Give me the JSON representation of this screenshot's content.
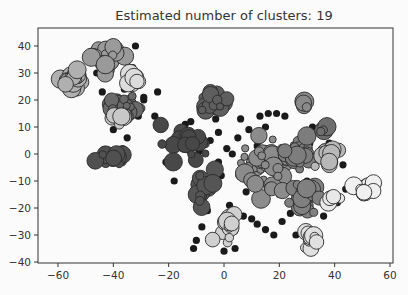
{
  "chart_data": {
    "type": "scatter",
    "title": "Estimated number of clusters: 19",
    "xlabel": "",
    "ylabel": "",
    "xlim": [
      -65,
      63
    ],
    "ylim": [
      -41,
      46
    ],
    "xticks": [
      -60,
      -40,
      -20,
      0,
      20,
      40,
      60
    ],
    "yticks": [
      40,
      30,
      20,
      10,
      0,
      -10,
      -20,
      -30,
      -40
    ],
    "xtick_labels": [
      "−60",
      "−40",
      "−20",
      "0",
      "20",
      "40",
      "60"
    ],
    "ytick_labels": [
      "40",
      "30",
      "20",
      "10",
      "0",
      "−10",
      "−20",
      "−30",
      "−40"
    ],
    "grid": false,
    "legend": null,
    "colormap": "grayscale",
    "n_clusters": 19,
    "noise_color": "#1a1a1a",
    "clusters": [
      {
        "id": 0,
        "center": [
          -42,
          36
        ],
        "spread": [
          5,
          4
        ],
        "color": "#9a9a9a",
        "n": 26
      },
      {
        "id": 1,
        "center": [
          -55,
          28
        ],
        "spread": [
          4,
          3
        ],
        "color": "#b0b0b0",
        "n": 20
      },
      {
        "id": 2,
        "center": [
          -33,
          27
        ],
        "spread": [
          3,
          3
        ],
        "color": "#dcdcdc",
        "n": 14
      },
      {
        "id": 3,
        "center": [
          -36,
          18
        ],
        "spread": [
          5,
          3
        ],
        "color": "#6a6a6a",
        "n": 22
      },
      {
        "id": 4,
        "center": [
          -38,
          13
        ],
        "spread": [
          3,
          2
        ],
        "color": "#c8c8c8",
        "n": 8
      },
      {
        "id": 5,
        "center": [
          -40,
          -1
        ],
        "spread": [
          5,
          3
        ],
        "color": "#505050",
        "n": 20
      },
      {
        "id": 6,
        "center": [
          -14,
          4
        ],
        "spread": [
          7,
          5
        ],
        "color": "#484848",
        "n": 24
      },
      {
        "id": 7,
        "center": [
          -3,
          18
        ],
        "spread": [
          4,
          4
        ],
        "color": "#5e5e5e",
        "n": 18
      },
      {
        "id": 8,
        "center": [
          -7,
          -12
        ],
        "spread": [
          3,
          6
        ],
        "color": "#555555",
        "n": 16
      },
      {
        "id": 9,
        "center": [
          2,
          -28
        ],
        "spread": [
          3,
          4
        ],
        "color": "#d0d0d0",
        "n": 16
      },
      {
        "id": 10,
        "center": [
          15,
          -4
        ],
        "spread": [
          7,
          8
        ],
        "color": "#8c8c8c",
        "n": 40
      },
      {
        "id": 11,
        "center": [
          27,
          2
        ],
        "spread": [
          5,
          6
        ],
        "color": "#7d7d7d",
        "n": 30
      },
      {
        "id": 12,
        "center": [
          28,
          -17
        ],
        "spread": [
          5,
          5
        ],
        "color": "#808080",
        "n": 24
      },
      {
        "id": 13,
        "center": [
          31,
          -32
        ],
        "spread": [
          3,
          3
        ],
        "color": "#e0e0e0",
        "n": 12
      },
      {
        "id": 14,
        "center": [
          37,
          0
        ],
        "spread": [
          3,
          3
        ],
        "color": "#b8b8b8",
        "n": 14
      },
      {
        "id": 15,
        "center": [
          52,
          -13
        ],
        "spread": [
          3,
          2
        ],
        "color": "#f0f0f0",
        "n": 12
      },
      {
        "id": 16,
        "center": [
          29,
          19
        ],
        "spread": [
          1.5,
          1.5
        ],
        "color": "#8a8a8a",
        "n": 5
      },
      {
        "id": 17,
        "center": [
          36,
          10
        ],
        "spread": [
          1.5,
          1.5
        ],
        "color": "#6e6e6e",
        "n": 5
      },
      {
        "id": 18,
        "center": [
          39,
          -16
        ],
        "spread": [
          2,
          2
        ],
        "color": "#e8e8e8",
        "n": 8
      }
    ],
    "noise_points": [
      [
        -32,
        40
      ],
      [
        -48,
        38
      ],
      [
        -33,
        32
      ],
      [
        -36,
        24
      ],
      [
        -29,
        20
      ],
      [
        -29,
        21
      ],
      [
        -40,
        9
      ],
      [
        -35,
        6
      ],
      [
        -24,
        23
      ],
      [
        -31,
        14
      ],
      [
        -14,
        11
      ],
      [
        -21,
        -3
      ],
      [
        -12,
        12
      ],
      [
        -2,
        8
      ],
      [
        -5,
        5
      ],
      [
        1,
        2
      ],
      [
        3,
        0
      ],
      [
        -2,
        -3
      ],
      [
        5,
        6
      ],
      [
        -3,
        13
      ],
      [
        6,
        13
      ],
      [
        13,
        14
      ],
      [
        16,
        15
      ],
      [
        19,
        15
      ],
      [
        9,
        9
      ],
      [
        -1,
        -8
      ],
      [
        -6,
        -21
      ],
      [
        -8,
        -27
      ],
      [
        2,
        -19
      ],
      [
        1,
        -25
      ],
      [
        7,
        -23
      ],
      [
        10,
        -24
      ],
      [
        12,
        -26
      ],
      [
        -11,
        -35
      ],
      [
        -10,
        -32
      ],
      [
        0,
        -36
      ],
      [
        4,
        -35
      ],
      [
        15,
        -28
      ],
      [
        18,
        -30
      ],
      [
        8,
        -14
      ],
      [
        24,
        -22
      ],
      [
        36,
        -23
      ],
      [
        26,
        -30
      ],
      [
        37,
        -19
      ],
      [
        41,
        -18
      ],
      [
        44,
        -13
      ],
      [
        22,
        14
      ],
      [
        15,
        10
      ],
      [
        32,
        10
      ],
      [
        31,
        4
      ],
      [
        38,
        4
      ],
      [
        40,
        -3
      ],
      [
        43,
        -4
      ],
      [
        -9,
        1
      ],
      [
        -7,
        -10
      ],
      [
        -18,
        -10
      ],
      [
        20,
        -15
      ],
      [
        21,
        -25
      ],
      [
        10,
        -5
      ],
      [
        12,
        3
      ],
      [
        34,
        -12
      ],
      [
        30,
        -10
      ],
      [
        -44,
        23
      ],
      [
        -46,
        30
      ],
      [
        -38,
        40
      ],
      [
        -25,
        14
      ]
    ]
  },
  "figure": {
    "background": "#fbfbfb",
    "axes_color": "#333333"
  }
}
